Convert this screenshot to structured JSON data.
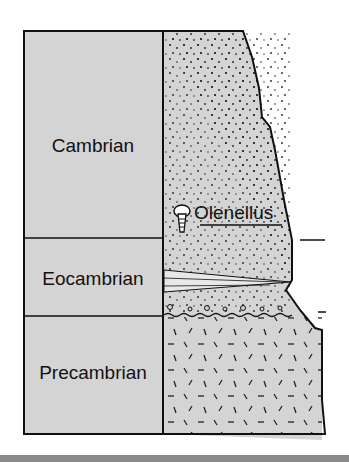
{
  "diagram": {
    "type": "stratigraphic-column",
    "units": [
      {
        "label": "Cambrian"
      },
      {
        "label": "Eocambrian"
      },
      {
        "label": "Precambrian"
      }
    ],
    "fossil": {
      "label": "Olenellus",
      "icon": "trilobite-icon"
    },
    "colors": {
      "fill": "#d4d4d4",
      "line": "#111111",
      "bar": "#8a8a8a"
    }
  }
}
